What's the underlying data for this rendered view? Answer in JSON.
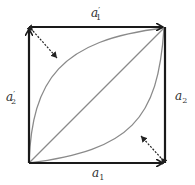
{
  "diagram": {
    "labels": {
      "top": {
        "base": "a",
        "prime": "′",
        "sub": "1"
      },
      "left": {
        "base": "a",
        "prime": "′",
        "sub": "2"
      },
      "right": {
        "base": "a",
        "sub": "2"
      },
      "bottom": {
        "base": "a",
        "sub": "1"
      }
    },
    "colors": {
      "edge": "#1a1a1a",
      "curve": "#8a8a8a",
      "dashed": "#222222"
    }
  }
}
